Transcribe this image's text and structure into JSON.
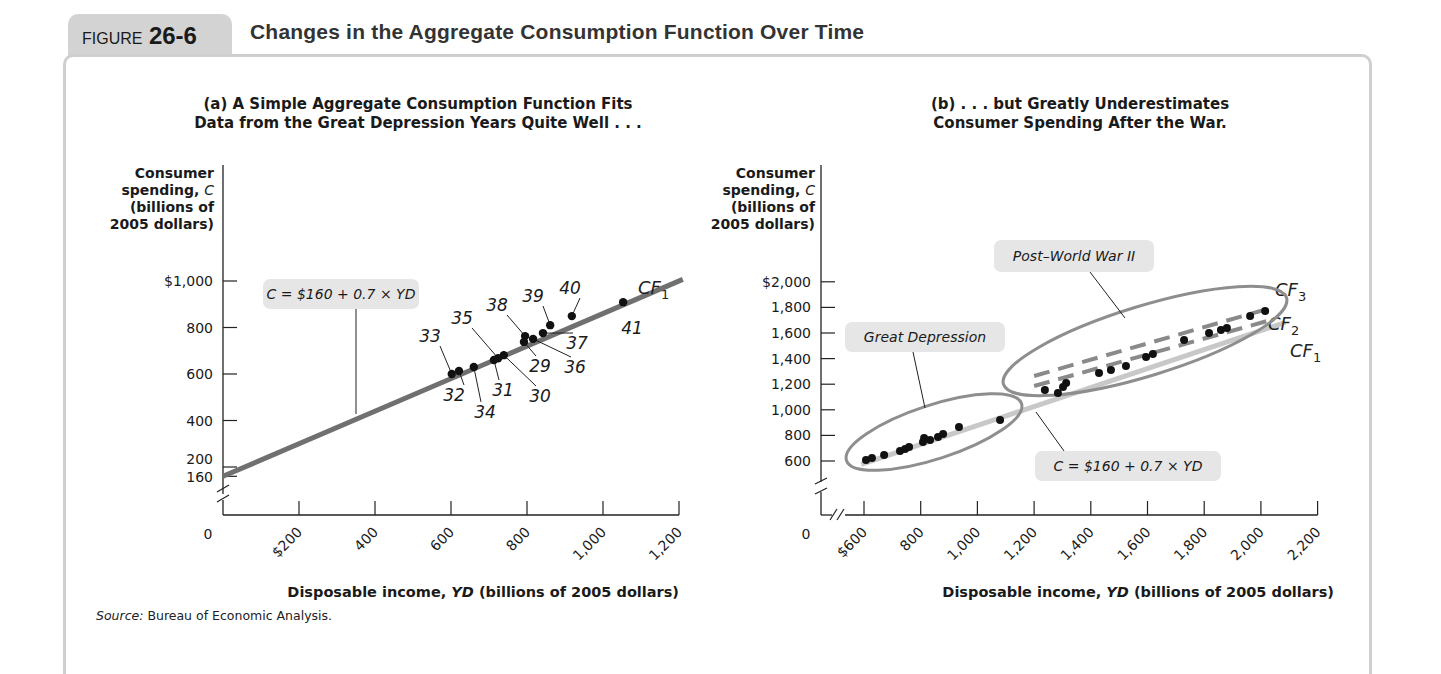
{
  "figure": {
    "label": "FIGURE",
    "number": "26-6",
    "title": "Changes in the Aggregate Consumption Function Over Time",
    "source_label": "Source:",
    "source_text": "Bureau of Economic Analysis."
  },
  "colors": {
    "tab_bg": "#d3d3d3",
    "frame": "#cfcfcf",
    "cf1_line_a": "#707070",
    "cf1_line_b": "#c8c8c8",
    "cf_dashed": "#8a8a8a",
    "ellipse": "#8e8e8e",
    "label_box": "#e6e6e6",
    "dot": "#111111"
  },
  "chart_data": [
    {
      "type": "scatter",
      "panel": "a",
      "title_line1": "(a) A Simple Aggregate Consumption Function Fits",
      "title_line2": "Data from the Great Depression Years Quite Well . . .",
      "ylabel_lines": [
        "Consumer",
        "spending, C",
        "(billions of",
        "2005 dollars)"
      ],
      "xlabel": "Disposable income, YD (billions of 2005 dollars)",
      "xlabel_pre": "Disposable income, ",
      "xlabel_var": "YD",
      "xlabel_post": " (billions of 2005 dollars)",
      "origin_label": "0",
      "xticks": [
        200,
        400,
        600,
        800,
        1000,
        1200
      ],
      "xtick_labels": [
        "$200",
        "400",
        "600",
        "800",
        "1,000",
        "1,200"
      ],
      "yticks": [
        160,
        200,
        400,
        600,
        800,
        1000
      ],
      "ytick_labels": [
        "160",
        "200",
        "400",
        "600",
        "800",
        "$1,000"
      ],
      "xlim": [
        0,
        1200
      ],
      "ylim": [
        160,
        1000
      ],
      "axis_break": true,
      "grid": false,
      "line": {
        "name": "CF1",
        "label_main": "CF",
        "label_sub": "1",
        "intercept": 160,
        "slope": 0.7
      },
      "equation_label": "C = $160 + 0.7 × YD",
      "points": [
        {
          "year": "29",
          "x": 792,
          "y": 738
        },
        {
          "year": "30",
          "x": 739,
          "y": 681
        },
        {
          "year": "31",
          "x": 713,
          "y": 660
        },
        {
          "year": "32",
          "x": 621,
          "y": 613
        },
        {
          "year": "33",
          "x": 602,
          "y": 600
        },
        {
          "year": "34",
          "x": 660,
          "y": 630
        },
        {
          "year": "35",
          "x": 724,
          "y": 668
        },
        {
          "year": "36",
          "x": 816,
          "y": 751
        },
        {
          "year": "37",
          "x": 842,
          "y": 776
        },
        {
          "year": "38",
          "x": 795,
          "y": 763
        },
        {
          "year": "39",
          "x": 861,
          "y": 810
        },
        {
          "year": "40",
          "x": 918,
          "y": 849
        },
        {
          "year": "41",
          "x": 1053,
          "y": 909
        }
      ]
    },
    {
      "type": "scatter",
      "panel": "b",
      "title_line1": "(b) . . . but Greatly Underestimates",
      "title_line2": "Consumer Spending After the War.",
      "ylabel_lines": [
        "Consumer",
        "spending, C",
        "(billions of",
        "2005 dollars)"
      ],
      "xlabel": "Disposable income, YD (billions of 2005 dollars)",
      "xlabel_pre": "Disposable income, ",
      "xlabel_var": "YD",
      "xlabel_post": " (billions of 2005 dollars)",
      "origin_label": "0",
      "xticks": [
        600,
        800,
        1000,
        1200,
        1400,
        1600,
        1800,
        2000,
        2200
      ],
      "xtick_labels": [
        "$600",
        "800",
        "1,000",
        "1,200",
        "1,400",
        "1,600",
        "1,800",
        "2,000",
        "2,200"
      ],
      "yticks": [
        600,
        800,
        1000,
        1200,
        1400,
        1600,
        1800,
        2000
      ],
      "ytick_labels": [
        "600",
        "800",
        "1,000",
        "1,200",
        "1,400",
        "1,600",
        "1,800",
        "$2,000"
      ],
      "xlim": [
        600,
        2200
      ],
      "ylim": [
        600,
        2000
      ],
      "axis_break": true,
      "grid": false,
      "lines": [
        {
          "name": "CF1",
          "label_main": "CF",
          "label_sub": "1",
          "style": "solid-light",
          "intercept": 160,
          "slope": 0.7
        },
        {
          "name": "CF2",
          "label_main": "CF",
          "label_sub": "2",
          "style": "dashed"
        },
        {
          "name": "CF3",
          "label_main": "CF",
          "label_sub": "3",
          "style": "dashed"
        }
      ],
      "equation_label": "C = $160 + 0.7 × YD",
      "annotations": [
        "Great Depression",
        "Post–World War II"
      ],
      "series": [
        {
          "name": "Great Depression",
          "points": [
            {
              "x": 607,
              "y": 608
            },
            {
              "x": 628,
              "y": 623
            },
            {
              "x": 671,
              "y": 647
            },
            {
              "x": 727,
              "y": 678
            },
            {
              "x": 745,
              "y": 694
            },
            {
              "x": 759,
              "y": 709
            },
            {
              "x": 808,
              "y": 748
            },
            {
              "x": 812,
              "y": 780
            },
            {
              "x": 833,
              "y": 764
            },
            {
              "x": 861,
              "y": 788
            },
            {
              "x": 879,
              "y": 811
            },
            {
              "x": 935,
              "y": 866
            },
            {
              "x": 1080,
              "y": 920
            }
          ]
        },
        {
          "name": "Post–World War II",
          "points": [
            {
              "x": 1238,
              "y": 1155
            },
            {
              "x": 1284,
              "y": 1131
            },
            {
              "x": 1302,
              "y": 1178
            },
            {
              "x": 1313,
              "y": 1209
            },
            {
              "x": 1429,
              "y": 1288
            },
            {
              "x": 1471,
              "y": 1311
            },
            {
              "x": 1524,
              "y": 1342
            },
            {
              "x": 1595,
              "y": 1413
            },
            {
              "x": 1619,
              "y": 1436
            },
            {
              "x": 1729,
              "y": 1545
            },
            {
              "x": 1817,
              "y": 1600
            },
            {
              "x": 1859,
              "y": 1623
            },
            {
              "x": 1880,
              "y": 1639
            },
            {
              "x": 1962,
              "y": 1733
            },
            {
              "x": 2015,
              "y": 1772
            }
          ]
        }
      ]
    }
  ]
}
